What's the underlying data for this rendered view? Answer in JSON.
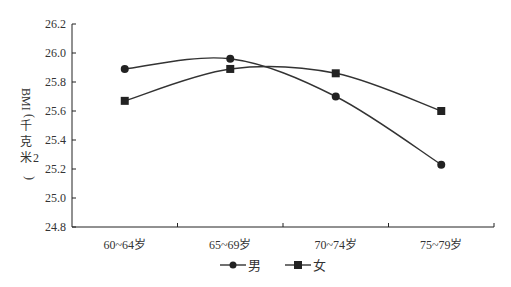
{
  "chart_data": {
    "type": "line",
    "title": "",
    "xlabel": "",
    "ylabel": "BMI（千克/米²）",
    "categories": [
      "60~64岁",
      "65~69岁",
      "70~74岁",
      "75~79岁"
    ],
    "series": [
      {
        "name": "男",
        "marker": "circle",
        "values": [
          25.89,
          25.96,
          25.7,
          25.23
        ]
      },
      {
        "name": "女",
        "marker": "square",
        "values": [
          25.67,
          25.89,
          25.86,
          25.6
        ]
      }
    ],
    "ylim": [
      24.8,
      26.2
    ],
    "yticks": [
      "24.8",
      "25.0",
      "25.2",
      "25.4",
      "25.6",
      "25.8",
      "26.0",
      "26.2"
    ],
    "grid": false,
    "smooth": true,
    "legend_position": "bottom"
  },
  "colors": {
    "line": "#333333",
    "marker": "#222222",
    "axis": "#222222"
  }
}
